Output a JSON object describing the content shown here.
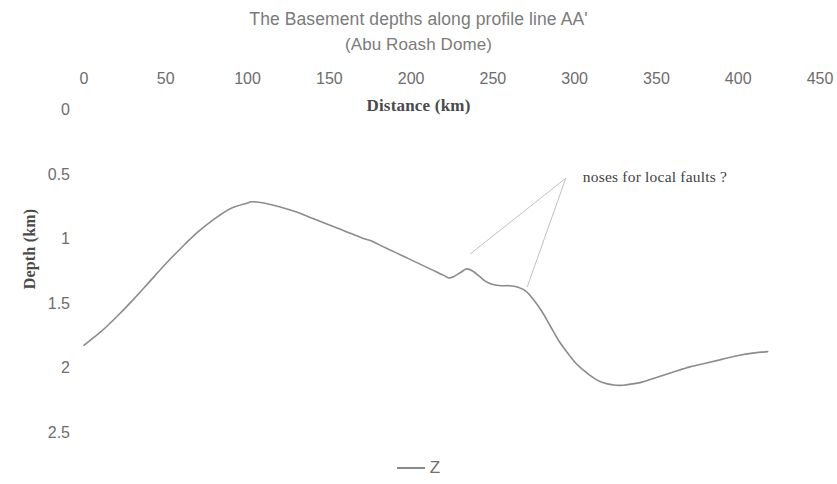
{
  "chart_data": {
    "type": "line",
    "title": "The Basement depths along profile line AA'",
    "subtitle": "(Abu Roash Dome)",
    "xlabel": "Distance (km)",
    "ylabel": "Depth (km)",
    "xlim": [
      0,
      450
    ],
    "ylim": [
      0,
      2.5
    ],
    "y_inverted": true,
    "x_axis_position": "top",
    "grid": false,
    "legend_position": "bottom",
    "xticks": [
      0,
      50,
      100,
      150,
      200,
      250,
      300,
      350,
      400,
      450
    ],
    "xtick_labels": [
      "0",
      "50",
      "100",
      "150",
      "200",
      "250",
      "300",
      "350",
      "400",
      "450"
    ],
    "yticks": [
      0,
      0.5,
      1,
      1.5,
      2,
      2.5
    ],
    "ytick_labels": [
      "0",
      "0.5",
      "1",
      "1.5",
      "2",
      "2.5"
    ],
    "line_color": "#8c8c8c",
    "series": [
      {
        "name": "Z",
        "x": [
          0,
          10,
          20,
          30,
          40,
          50,
          60,
          70,
          80,
          90,
          100,
          103,
          110,
          120,
          130,
          140,
          150,
          160,
          170,
          175,
          180,
          190,
          200,
          210,
          215,
          220,
          223,
          226,
          230,
          234,
          238,
          242,
          246,
          250,
          255,
          260,
          265,
          270,
          275,
          280,
          285,
          290,
          295,
          300,
          305,
          310,
          315,
          320,
          325,
          330,
          335,
          340,
          350,
          360,
          370,
          380,
          390,
          400,
          410,
          418
        ],
        "y": [
          1.82,
          1.72,
          1.6,
          1.47,
          1.33,
          1.19,
          1.06,
          0.94,
          0.84,
          0.76,
          0.72,
          0.71,
          0.72,
          0.75,
          0.79,
          0.84,
          0.89,
          0.94,
          0.99,
          1.01,
          1.04,
          1.1,
          1.16,
          1.22,
          1.25,
          1.28,
          1.3,
          1.29,
          1.26,
          1.23,
          1.25,
          1.29,
          1.33,
          1.35,
          1.36,
          1.36,
          1.37,
          1.4,
          1.47,
          1.56,
          1.67,
          1.78,
          1.87,
          1.95,
          2.01,
          2.06,
          2.1,
          2.12,
          2.13,
          2.13,
          2.12,
          2.11,
          2.07,
          2.03,
          1.99,
          1.96,
          1.93,
          1.9,
          1.88,
          1.87
        ]
      }
    ],
    "annotations": [
      {
        "text": "noses for local faults ?",
        "x": 305,
        "y": 0.52,
        "leader_targets": [
          [
            236,
            1.115
          ],
          [
            271,
            1.37
          ]
        ]
      }
    ]
  },
  "legend": {
    "items": [
      {
        "label": "Z",
        "color": "#8a8a8a"
      }
    ]
  }
}
